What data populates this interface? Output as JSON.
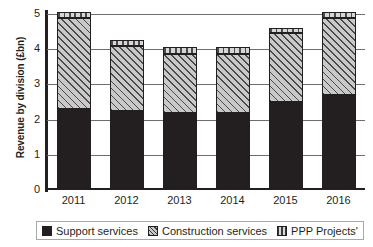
{
  "chart_data": {
    "type": "bar",
    "stacked": true,
    "title": "",
    "xlabel": "",
    "ylabel": "Revenue by division (£bn)",
    "categories": [
      "2011",
      "2012",
      "2013",
      "2014",
      "2015",
      "2016"
    ],
    "ylim": [
      0,
      5
    ],
    "yticks": [
      "5",
      "4",
      "3",
      "2",
      "1",
      "0"
    ],
    "ytick_values": [
      5,
      4,
      3,
      2,
      1,
      0
    ],
    "grid": true,
    "legend_position": "bottom",
    "series": [
      {
        "name": "Support services",
        "pattern": "solid",
        "color": "#231f20",
        "values": [
          2.3,
          2.25,
          2.2,
          2.2,
          2.5,
          2.7
        ]
      },
      {
        "name": "Construction services",
        "pattern": "diagonal-hatch",
        "color": "#c9c9c9",
        "values": [
          2.6,
          1.85,
          1.65,
          1.65,
          1.95,
          2.2
        ]
      },
      {
        "name": "PPP Projects'",
        "pattern": "vertical-hatch",
        "color": "#d6d6d6",
        "values": [
          0.15,
          0.15,
          0.2,
          0.2,
          0.15,
          0.15
        ]
      }
    ],
    "totals": [
      5.05,
      4.25,
      4.05,
      4.05,
      4.6,
      5.05
    ]
  },
  "legend": {
    "items": [
      {
        "label": "Support services"
      },
      {
        "label": "Construction services"
      },
      {
        "label": "PPP Projects'"
      }
    ]
  }
}
